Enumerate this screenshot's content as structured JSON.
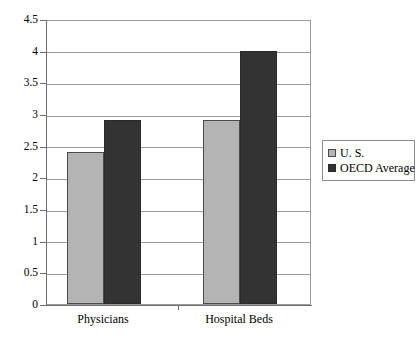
{
  "chart_data": {
    "type": "bar",
    "title": "",
    "subtitle": "",
    "xlabel": "",
    "ylabel": "",
    "categories": [
      "Physicians",
      "Hospital Beds"
    ],
    "series": [
      {
        "name": "U. S.",
        "values": [
          2.4,
          2.9
        ],
        "color": "#b4b4b4"
      },
      {
        "name": "OECD Average",
        "values": [
          2.9,
          4.0
        ],
        "color": "#333333"
      }
    ],
    "ylim": [
      0,
      4.5
    ],
    "ytick_step": 0.5,
    "yticks": [
      "0",
      "0.5",
      "1",
      "1.5",
      "2",
      "2.5",
      "3",
      "3.5",
      "4",
      "4.5"
    ],
    "grid": true,
    "grid_axis": "y",
    "legend_position": "right",
    "plot_border": true
  },
  "legend": {
    "entries": [
      {
        "label": "U. S."
      },
      {
        "label": "OECD Average"
      }
    ]
  },
  "colors": {
    "series_us": "#b4b4b4",
    "series_oecd": "#333333",
    "gridline": "#9a9a9a",
    "axis": "#6f6f6f",
    "background": "#ffffff",
    "text": "#000000"
  }
}
